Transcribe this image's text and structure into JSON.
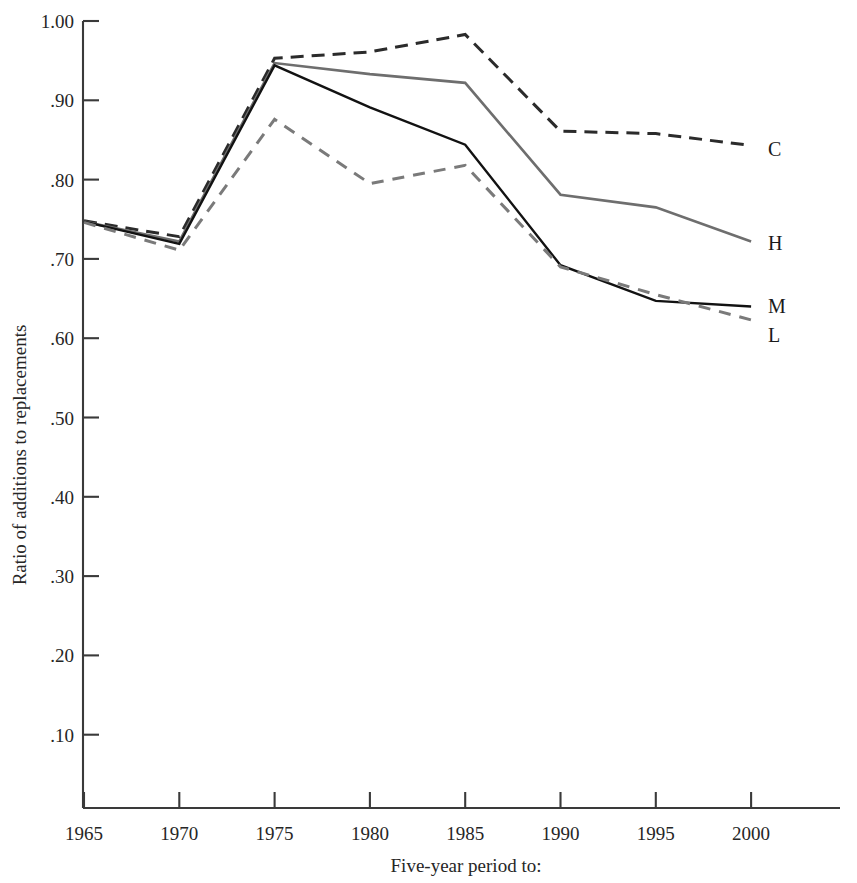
{
  "chart_data": {
    "type": "line",
    "title": "",
    "xlabel": "Five-year period to:",
    "ylabel": "Ratio of additions to replacements",
    "x": [
      1965,
      1970,
      1975,
      1980,
      1985,
      1990,
      1995,
      2000
    ],
    "xtick_labels": [
      "1965",
      "1970",
      "1975",
      "1980",
      "1985",
      "1990",
      "1995",
      "2000"
    ],
    "ytick_labels": [
      "1.00",
      ".90",
      ".80",
      ".70",
      ".60",
      ".50",
      ".40",
      ".30",
      ".20",
      ".10"
    ],
    "ytick_values": [
      1.0,
      0.9,
      0.8,
      0.7,
      0.6,
      0.5,
      0.4,
      0.3,
      0.2,
      0.1
    ],
    "ylim": [
      0.0,
      1.0
    ],
    "xlim": [
      1965,
      2003
    ],
    "grid": false,
    "legend_position": "right-end-of-line",
    "series": [
      {
        "name": "C",
        "label": "C",
        "color": "#2b2b2b",
        "style": "dashed",
        "dash": "13,8",
        "width": 3.0,
        "values": [
          0.748,
          0.728,
          0.953,
          0.961,
          0.983,
          0.861,
          0.858,
          0.843
        ],
        "label_y": 0.838
      },
      {
        "name": "H",
        "label": "H",
        "color": "#6e6e6e",
        "style": "solid",
        "dash": "none",
        "width": 2.6,
        "values": [
          0.747,
          0.722,
          0.947,
          0.933,
          0.922,
          0.781,
          0.765,
          0.722
        ],
        "label_y": 0.72
      },
      {
        "name": "M",
        "label": "M",
        "color": "#121212",
        "style": "solid",
        "dash": "none",
        "width": 2.4,
        "values": [
          0.747,
          0.719,
          0.944,
          0.891,
          0.844,
          0.692,
          0.647,
          0.64
        ],
        "label_y": 0.64
      },
      {
        "name": "L",
        "label": "L",
        "color": "#7a7a7a",
        "style": "dashed",
        "dash": "12,9",
        "width": 3.0,
        "values": [
          0.746,
          0.711,
          0.876,
          0.795,
          0.818,
          0.69,
          0.655,
          0.623
        ],
        "label_y": 0.604
      }
    ]
  },
  "axes": {
    "x_axis_name": "x-axis",
    "y_axis_name": "y-axis"
  }
}
